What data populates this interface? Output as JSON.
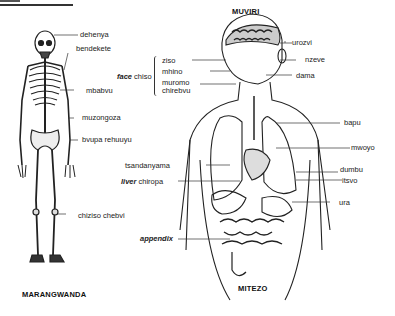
{
  "titles": {
    "skeleton": "MARANGWANDA",
    "body": "MUVIRI",
    "organs": "MITEZO"
  },
  "skeleton_labels": [
    {
      "text": "dehenya"
    },
    {
      "text": "bendekete"
    },
    {
      "text": "mbabvu"
    },
    {
      "text": "muzongoza"
    },
    {
      "text": "bvupa rehuuyu"
    },
    {
      "text": "chiziso chebvi"
    }
  ],
  "face_group": {
    "label_en": "face",
    "label_sn": "chiso",
    "items": [
      "ziso",
      "mhino",
      "muromo",
      "chirebvu"
    ]
  },
  "body_labels_right": [
    {
      "text": "urozvi"
    },
    {
      "text": "nzeve"
    },
    {
      "text": "dama"
    },
    {
      "text": "bapu"
    },
    {
      "text": "mwoyo"
    },
    {
      "text": "dumbu"
    },
    {
      "text": "itsvo"
    },
    {
      "text": "ura"
    }
  ],
  "body_labels_left": [
    {
      "text": "tsandanyama"
    },
    {
      "text": "liver",
      "text_sn": "chiropa"
    },
    {
      "text": "appendix"
    }
  ]
}
